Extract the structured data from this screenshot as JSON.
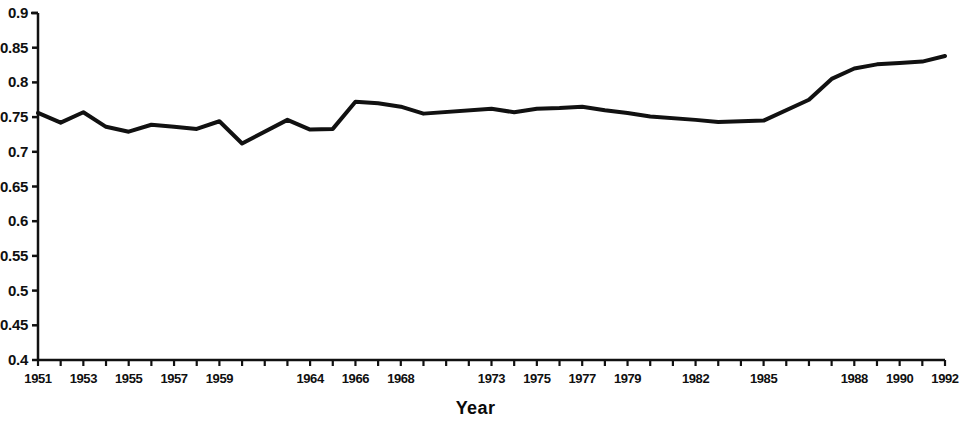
{
  "chart_data": {
    "type": "line",
    "title": "",
    "xlabel": "Year",
    "ylabel": "",
    "xlim": [
      1951,
      1992
    ],
    "ylim": [
      0.4,
      0.9
    ],
    "grid": false,
    "legend": null,
    "y_ticks": [
      "0.9",
      "0.85",
      "0.8",
      "0.75",
      "0.7",
      "0.65",
      "0.6",
      "0.55",
      "0.5",
      "0.45",
      "0.4"
    ],
    "y_tick_values": [
      0.9,
      0.85,
      0.8,
      0.75,
      0.7,
      0.65,
      0.6,
      0.55,
      0.5,
      0.45,
      0.4
    ],
    "x_tick_labels": [
      "1951",
      "1953",
      "1955",
      "1957",
      "1959",
      "1964",
      "1966",
      "1968",
      "1973",
      "1975",
      "1977",
      "1979",
      "1982",
      "1985",
      "1988",
      "1990",
      "1992"
    ],
    "x": [
      1951,
      1952,
      1953,
      1954,
      1955,
      1956,
      1957,
      1958,
      1959,
      1960,
      1964,
      1965,
      1966,
      1967,
      1968,
      1969,
      1970,
      1973,
      1974,
      1975,
      1976,
      1977,
      1978,
      1979,
      1980,
      1982,
      1983,
      1984,
      1985,
      1986,
      1987,
      1988,
      1989,
      1990,
      1991,
      1992
    ],
    "values": [
      0.756,
      0.742,
      0.757,
      0.736,
      0.729,
      0.739,
      0.736,
      0.733,
      0.744,
      0.712,
      0.746,
      0.732,
      0.733,
      0.772,
      0.77,
      0.765,
      0.755,
      0.762,
      0.757,
      0.762,
      0.763,
      0.765,
      0.76,
      0.756,
      0.751,
      0.746,
      0.743,
      0.744,
      0.745,
      0.775,
      0.805,
      0.82,
      0.826,
      0.828,
      0.83,
      0.838
    ],
    "line_color": "#111111",
    "line_width": 4,
    "axis_color": "#111111",
    "note": "y-axis tick labels are clipped at the left edge of the image"
  },
  "axes": {
    "x_left_px": 38,
    "x_right_px": 945,
    "y_top_px": 13,
    "y_bottom_px": 360
  }
}
